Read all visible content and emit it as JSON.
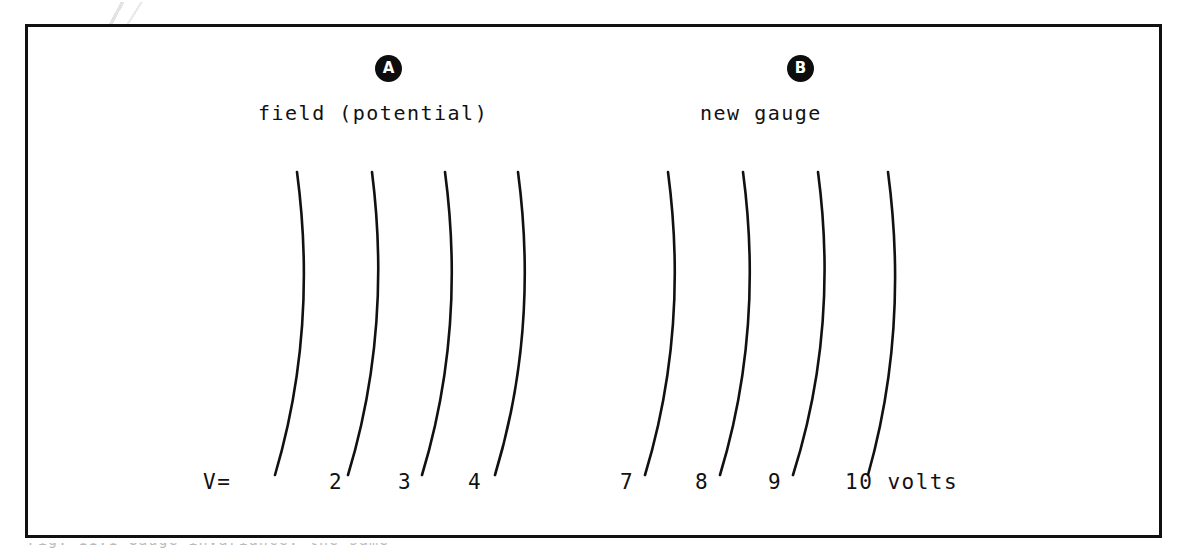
{
  "figure": {
    "panels": [
      {
        "marker": "A",
        "caption": "field (potential)"
      },
      {
        "marker": "B",
        "caption": "new gauge"
      }
    ],
    "axis": {
      "prefix_label": "V=",
      "units_label": "10 volts"
    },
    "cut_off_caption": "Fig. 11.1  Gauge invariance: the same physical field",
    "colors": {
      "ink": "#111111",
      "paper": "#ffffff",
      "marker_fill": "#0d0d0d",
      "marker_text": "#ffffff"
    }
  },
  "chart_data": {
    "type": "line",
    "title": "",
    "xlabel": "V=",
    "ylabel": "",
    "grid": false,
    "legend": "none",
    "series": [
      {
        "name": "1",
        "panel": "A",
        "label": "1",
        "label_x": 268,
        "top": [
          297,
          172
        ],
        "control": [
          318,
          330
        ],
        "bottom": [
          275,
          475
        ]
      },
      {
        "name": "2",
        "panel": "A",
        "label": "2",
        "label_x": 329,
        "top": [
          372,
          172
        ],
        "control": [
          392,
          330
        ],
        "bottom": [
          348,
          475
        ]
      },
      {
        "name": "3",
        "panel": "A",
        "label": "3",
        "label_x": 398,
        "top": [
          445,
          172
        ],
        "control": [
          466,
          330
        ],
        "bottom": [
          422,
          475
        ]
      },
      {
        "name": "4",
        "panel": "A",
        "label": "4",
        "label_x": 468,
        "top": [
          518,
          172
        ],
        "control": [
          539,
          330
        ],
        "bottom": [
          495,
          475
        ]
      },
      {
        "name": "7",
        "panel": "B",
        "label": "7",
        "label_x": 620,
        "top": [
          668,
          172
        ],
        "control": [
          689,
          330
        ],
        "bottom": [
          645,
          475
        ]
      },
      {
        "name": "8",
        "panel": "B",
        "label": "8",
        "label_x": 695,
        "top": [
          743,
          172
        ],
        "control": [
          764,
          330
        ],
        "bottom": [
          720,
          475
        ]
      },
      {
        "name": "9",
        "panel": "B",
        "label": "9",
        "label_x": 768,
        "top": [
          818,
          172
        ],
        "control": [
          839,
          330
        ],
        "bottom": [
          793,
          475
        ]
      },
      {
        "name": "10",
        "panel": "B",
        "label": "10",
        "label_x": 845,
        "top": [
          888,
          172
        ],
        "control": [
          909,
          330
        ],
        "bottom": [
          868,
          475
        ]
      }
    ],
    "categories": [
      "1",
      "2",
      "3",
      "4",
      "7",
      "8",
      "9",
      "10"
    ],
    "values": [
      1,
      2,
      3,
      4,
      7,
      8,
      9,
      10
    ],
    "value_units": "volts"
  }
}
